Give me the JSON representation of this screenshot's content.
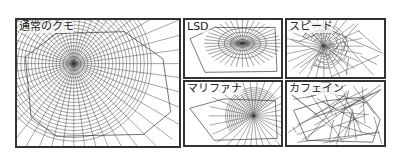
{
  "figure": {
    "panels": [
      {
        "id": "normal",
        "label": "通常のクモ"
      },
      {
        "id": "lsd",
        "label": "LSD"
      },
      {
        "id": "speed",
        "label": "スピード"
      },
      {
        "id": "marijuana",
        "label": "マリファナ"
      },
      {
        "id": "caffeine",
        "label": "カフェイン"
      }
    ]
  }
}
